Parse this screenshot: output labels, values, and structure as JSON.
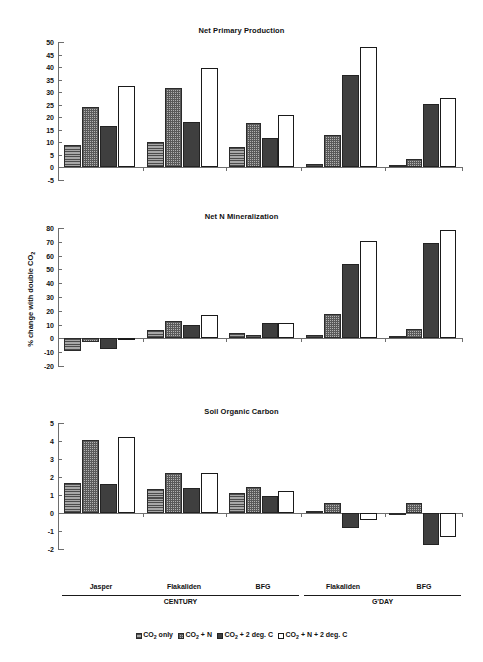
{
  "figure": {
    "y_axis_caption": "% change with double CO2",
    "group_axis": {
      "site_labels": [
        "Jasper",
        "Flakaliden",
        "BFG",
        "Flakaliden",
        "BFG"
      ],
      "model_labels": [
        "CENTURY",
        "G'DAY"
      ]
    },
    "legend": {
      "position": "bottom-center",
      "entries": [
        {
          "label": "CO2 only",
          "pattern": "horizontal-lines",
          "color": "#8e8e8e"
        },
        {
          "label": "CO2 + N",
          "pattern": "stippled-crosshatch",
          "color": "#b2b2b2"
        },
        {
          "label": "CO2 + 2 deg. C",
          "pattern": "solid-dark",
          "color": "#3f3f3f"
        },
        {
          "label": "CO2 + N + 2 deg. C",
          "pattern": "open-white",
          "color": "#ffffff"
        }
      ]
    }
  },
  "chart_data": [
    {
      "type": "bar",
      "title": "Net Primary Production",
      "xlabel": "",
      "ylabel": "% change with double CO2",
      "ylim": [
        -5,
        50
      ],
      "yticks": [
        -5,
        0,
        5,
        10,
        15,
        20,
        25,
        30,
        35,
        40,
        45,
        50
      ],
      "grid": false,
      "categories": [
        "Jasper",
        "Flakaliden",
        "BFG",
        "Flakaliden",
        "BFG"
      ],
      "category_groups": [
        "CENTURY",
        "CENTURY",
        "CENTURY",
        "G'DAY",
        "G'DAY"
      ],
      "series": [
        {
          "name": "CO2 only",
          "values": [
            9.0,
            10.2,
            8.0,
            1.5,
            1.0
          ]
        },
        {
          "name": "CO2 + N",
          "values": [
            24.2,
            31.5,
            17.8,
            13.0,
            3.3
          ]
        },
        {
          "name": "CO2 + 2 deg. C",
          "values": [
            16.7,
            18.2,
            11.8,
            36.8,
            25.3
          ]
        },
        {
          "name": "CO2 + N + 2 deg. C",
          "values": [
            32.4,
            39.6,
            20.8,
            48.2,
            27.8
          ]
        }
      ]
    },
    {
      "type": "bar",
      "title": "Net N Mineralization",
      "xlabel": "",
      "ylabel": "% change with double CO2",
      "ylim": [
        -20,
        80
      ],
      "yticks": [
        -20,
        -10,
        0,
        10,
        20,
        30,
        40,
        50,
        60,
        70,
        80
      ],
      "grid": false,
      "categories": [
        "Jasper",
        "Flakaliden",
        "BFG",
        "Flakaliden",
        "BFG"
      ],
      "category_groups": [
        "CENTURY",
        "CENTURY",
        "CENTURY",
        "G'DAY",
        "G'DAY"
      ],
      "series": [
        {
          "name": "CO2 only",
          "values": [
            -9.0,
            6.0,
            4.0,
            2.5,
            1.5
          ]
        },
        {
          "name": "CO2 + N",
          "values": [
            -2.5,
            12.5,
            2.5,
            17.5,
            6.5
          ]
        },
        {
          "name": "CO2 + 2 deg. C",
          "values": [
            -7.5,
            10.0,
            11.5,
            54.0,
            69.0
          ]
        },
        {
          "name": "CO2 + N + 2 deg. C",
          "values": [
            -1.5,
            16.8,
            11.5,
            70.3,
            78.5
          ]
        }
      ]
    },
    {
      "type": "bar",
      "title": "Soil Organic Carbon",
      "xlabel": "",
      "ylabel": "% change with double CO2",
      "ylim": [
        -2,
        5
      ],
      "yticks": [
        -2,
        -1,
        0,
        1,
        2,
        3,
        4,
        5
      ],
      "grid": false,
      "categories": [
        "Jasper",
        "Flakaliden",
        "BFG",
        "Flakaliden",
        "BFG"
      ],
      "category_groups": [
        "CENTURY",
        "CENTURY",
        "CENTURY",
        "G'DAY",
        "G'DAY"
      ],
      "series": [
        {
          "name": "CO2 only",
          "values": [
            1.65,
            1.35,
            1.1,
            0.1,
            -0.05
          ]
        },
        {
          "name": "CO2 + N",
          "values": [
            4.08,
            2.23,
            1.42,
            0.55,
            0.55
          ]
        },
        {
          "name": "CO2 + 2 deg. C",
          "values": [
            1.63,
            1.38,
            0.97,
            -0.85,
            -1.75
          ]
        },
        {
          "name": "CO2 + N + 2 deg. C",
          "values": [
            4.25,
            2.23,
            1.22,
            -0.4,
            -1.35
          ]
        }
      ]
    }
  ]
}
